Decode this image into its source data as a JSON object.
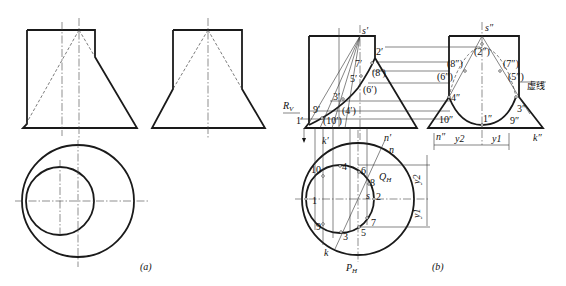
{
  "figure": {
    "panel_a": {
      "caption": "(a)"
    },
    "panel_b": {
      "caption": "(b)",
      "front_labels": {
        "apex": "s′",
        "p2": "2′",
        "p7": "7′",
        "p8": "(8′)",
        "p5": "5′",
        "p6": "(6′)",
        "p3": "3′",
        "p4": "(4′)",
        "p9": "9′",
        "p10": "(10′)",
        "p1": "1′",
        "rv": "R",
        "rv_sub": "V",
        "k": "k′",
        "n": "n′"
      },
      "side_labels": {
        "apex": "s″",
        "p2": "(2″)",
        "p8": "(8″)",
        "p7": "(7″)",
        "p6": "(6″)",
        "p5": "(5″)",
        "p4": "4″",
        "p3": "3″",
        "p10": "10″",
        "p1": "1″",
        "p9": "9″",
        "n": "n″",
        "k": "k″",
        "y2": "y2",
        "y1": "y1",
        "hidden_line_note": "虚线"
      },
      "top_labels": {
        "p10": "10",
        "p4": "4",
        "p6": "6",
        "p8": "8",
        "p2": "2",
        "p1": "1",
        "p9": "9",
        "p3": "3",
        "p5": "5",
        "p7": "7",
        "s": "s",
        "n": "n",
        "k": "k",
        "qh": "Q",
        "qh_sub": "H",
        "ph": "P",
        "ph_sub": "H",
        "y2": "y2",
        "y1": "y1"
      }
    }
  }
}
